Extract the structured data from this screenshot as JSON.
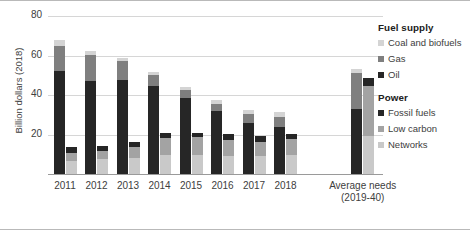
{
  "axis": {
    "y_title": "Billion dollars (2018)",
    "ticks": [
      "80",
      "60",
      "40",
      "20"
    ],
    "tick_values": [
      80,
      60,
      40,
      20
    ]
  },
  "legend": {
    "group1_title": "Fuel supply",
    "group1_items": [
      {
        "label": "Coal and biofuels",
        "color": "#d4d4d4"
      },
      {
        "label": "Gas",
        "color": "#7f7f7f"
      },
      {
        "label": "Oil",
        "color": "#262626"
      }
    ],
    "group2_title": "Power",
    "group2_items": [
      {
        "label": "Fossil fuels",
        "color": "#262626"
      },
      {
        "label": "Low carbon",
        "color": "#a3a3a3"
      },
      {
        "label": "Networks",
        "color": "#c9c9c9"
      }
    ]
  },
  "xlabels": [
    "2011",
    "2012",
    "2013",
    "2014",
    "2015",
    "2016",
    "2017",
    "2018",
    "Average needs",
    "(2019-40)"
  ],
  "chart_data": {
    "type": "bar",
    "title": "",
    "subtitle": "",
    "xlabel": "",
    "ylabel": "Billion dollars (2018)",
    "ylim": [
      0,
      80
    ],
    "yticks": [
      20,
      40,
      60,
      80
    ],
    "grid": true,
    "legend_position": "right",
    "stacked": true,
    "grouped": true,
    "categories": [
      "2011",
      "2012",
      "2013",
      "2014",
      "2015",
      "2016",
      "2017",
      "2018",
      "Average needs (2019-40)"
    ],
    "groups": [
      {
        "name": "Fuel supply",
        "series": [
          {
            "name": "Oil",
            "color": "#262626",
            "values": [
              52.0,
              47.0,
              47.5,
              44.5,
              38.5,
              32.0,
              26.0,
              24.0,
              33.0
            ]
          },
          {
            "name": "Gas",
            "color": "#7f7f7f",
            "values": [
              13.0,
              13.5,
              9.5,
              5.5,
              4.0,
              3.5,
              4.5,
              5.0,
              18.0
            ]
          },
          {
            "name": "Coal and biofuels",
            "color": "#d4d4d4",
            "values": [
              3.0,
              2.0,
              2.0,
              1.5,
              1.5,
              2.0,
              2.0,
              2.5,
              2.0
            ]
          }
        ],
        "totals": [
          68.0,
          62.5,
          59.0,
          51.5,
          44.0,
          37.5,
          32.5,
          31.5,
          53.0
        ]
      },
      {
        "name": "Power",
        "series": [
          {
            "name": "Networks",
            "color": "#c9c9c9",
            "values": [
              6.5,
              7.5,
              8.0,
              9.5,
              9.5,
              9.0,
              9.0,
              9.5,
              19.0
            ]
          },
          {
            "name": "Low carbon",
            "color": "#a3a3a3",
            "values": [
              4.0,
              4.0,
              5.5,
              8.5,
              9.0,
              8.0,
              7.0,
              8.0,
              25.5
            ]
          },
          {
            "name": "Fossil fuels",
            "color": "#262626",
            "values": [
              3.0,
              2.5,
              2.5,
              3.0,
              2.5,
              3.5,
              3.0,
              3.0,
              4.0
            ]
          }
        ],
        "totals": [
          13.5,
          14.0,
          16.0,
          21.0,
          21.0,
          20.5,
          19.0,
          20.5,
          48.5
        ]
      }
    ]
  }
}
